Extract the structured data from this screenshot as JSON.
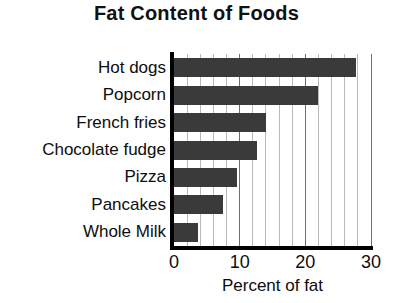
{
  "chart_data": {
    "type": "bar",
    "orientation": "horizontal",
    "title": "Fat Content of Foods",
    "xlabel": "Percent of fat",
    "ylabel": "",
    "categories": [
      "Hot dogs",
      "Popcorn",
      "French fries",
      "Chocolate fudge",
      "Pizza",
      "Pancakes",
      "Whole Milk"
    ],
    "values": [
      27.7,
      22,
      14,
      12.6,
      9.6,
      7.5,
      3.7
    ],
    "xlim": [
      0,
      30
    ],
    "xticks": [
      0,
      10,
      20,
      30
    ],
    "xtick_labels": [
      "0",
      "10",
      "20",
      "30"
    ],
    "minor_tick_step": 2,
    "grid": true,
    "grid_axis": "x",
    "legend": false,
    "bar_color": "#3a3a3a",
    "grid_color": "#b9b9b9",
    "major_grid_color": "#6e6e6e",
    "axis_color": "#000000",
    "background": "#ffffff"
  }
}
